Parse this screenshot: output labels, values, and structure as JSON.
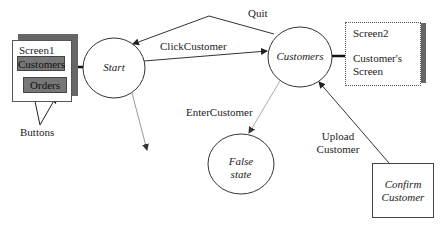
{
  "diagram": {
    "type": "state-transition",
    "nodes": {
      "start": {
        "label": "Start",
        "shape": "circle"
      },
      "customers": {
        "label": "Customers",
        "shape": "circle"
      },
      "false_state": {
        "label_line1": "False",
        "label_line2": "state",
        "shape": "circle"
      },
      "confirm_customer": {
        "label_line1": "Confirm",
        "label_line2": "Customer",
        "shape": "rectangle"
      }
    },
    "screens": {
      "screen1": {
        "title": "Screen1",
        "buttons": [
          "Customers",
          "Orders"
        ],
        "annotation": "Buttons"
      },
      "screen2": {
        "title": "Screen2",
        "caption_line1": "Customer's",
        "caption_line2": "Screen"
      }
    },
    "edges": {
      "quit": {
        "label": "Quit",
        "from": "Customers",
        "to": "Start"
      },
      "click_customer": {
        "label": "ClickCustomer",
        "from": "Start",
        "to": "Customers"
      },
      "enter_customer": {
        "label": "EnterCustomer",
        "from": "Customers",
        "to": "False state"
      },
      "upload_customer": {
        "label_line1": "Upload",
        "label_line2": "Customer",
        "from": "Confirm Customer",
        "to": "Customers"
      },
      "start_out": {
        "label": "",
        "from": "Start",
        "to": ""
      }
    }
  }
}
